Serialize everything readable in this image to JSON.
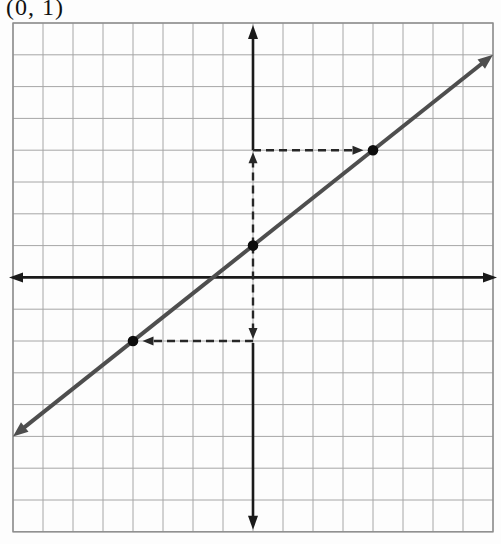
{
  "figure": {
    "label": "(0, 1)",
    "grid": {
      "left": 13,
      "top": 23,
      "cols": 16,
      "rows": 16,
      "cell_w": 30,
      "cell_h": 31.8,
      "line_color": "#a6a6a6",
      "border_color": "#8c8c8c"
    },
    "axes": {
      "color": "#1a1a1a",
      "width": 2.6,
      "y_col": 8,
      "x_row": 8,
      "y_axis_solid_above": 4,
      "y_axis_solid_below": -2
    },
    "line": {
      "color": "#4e4e4e",
      "width": 4,
      "slope": 0.75,
      "intercept": 1,
      "x_from": -8,
      "x_to": 8
    },
    "points": [
      [
        -4,
        -2
      ],
      [
        0,
        1
      ],
      [
        4,
        4
      ]
    ],
    "point_radius": 5.3,
    "point_color": "#0d0d0d",
    "dashed": {
      "color": "#272727",
      "width": 2.4,
      "dash": "8 5",
      "segments": [
        {
          "from": [
            0,
            1
          ],
          "to": [
            0,
            4
          ]
        },
        {
          "from": [
            0,
            4
          ],
          "to": [
            4,
            4
          ]
        },
        {
          "from": [
            0,
            1
          ],
          "to": [
            0,
            -2
          ]
        },
        {
          "from": [
            0,
            -2
          ],
          "to": [
            -4,
            -2
          ]
        }
      ]
    }
  },
  "chart_data": {
    "type": "line",
    "title": "",
    "xlabel": "",
    "ylabel": "",
    "x_range": [
      -8,
      8
    ],
    "y_range": [
      -8,
      8
    ],
    "grid": true,
    "grid_cells": [
      16,
      16
    ],
    "axes_arrows": true,
    "series": [
      {
        "name": "line through (0, 1) with slope 3/4",
        "slope": 0.75,
        "y_intercept": 1,
        "x": [
          -8,
          8
        ],
        "y": [
          -5,
          7
        ],
        "marked_points": [
          {
            "x": -4,
            "y": -2
          },
          {
            "x": 0,
            "y": 1
          },
          {
            "x": 4,
            "y": 4
          }
        ]
      }
    ],
    "annotations": [
      {
        "kind": "text",
        "text": "(0, 1)",
        "position": "top-left-of-figure",
        "refers_to_point": [
          0,
          1
        ]
      },
      {
        "kind": "dashed-arrow",
        "from": [
          0,
          1
        ],
        "to": [
          0,
          4
        ],
        "depicts": "rise +3"
      },
      {
        "kind": "dashed-arrow",
        "from": [
          0,
          4
        ],
        "to": [
          4,
          4
        ],
        "depicts": "run +4"
      },
      {
        "kind": "dashed-arrow",
        "from": [
          0,
          1
        ],
        "to": [
          0,
          -2
        ],
        "depicts": "rise -3"
      },
      {
        "kind": "dashed-arrow",
        "from": [
          0,
          -2
        ],
        "to": [
          -4,
          -2
        ],
        "depicts": "run -4"
      }
    ]
  }
}
